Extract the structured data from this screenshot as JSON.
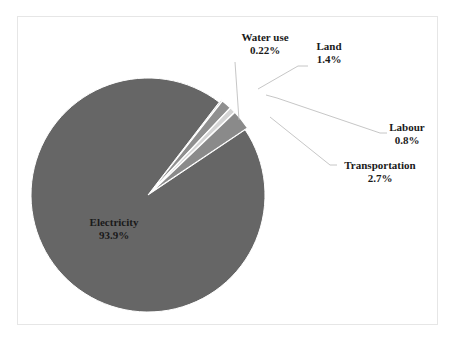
{
  "chart_data": {
    "type": "pie",
    "title": "",
    "categories": [
      "Electricity",
      "Water use",
      "Land",
      "Labour",
      "Transportation"
    ],
    "values": [
      93.9,
      0.22,
      1.4,
      0.8,
      2.7
    ],
    "value_labels": [
      "93.9%",
      "0.22%",
      "1.4%",
      "0.8%",
      "2.7%"
    ],
    "colors": [
      "#666666",
      "#a6a6a6",
      "#8f8f8f",
      "#d4d4d4",
      "#8a8a8a"
    ],
    "exploded": [
      "Water use",
      "Land",
      "Labour",
      "Transportation"
    ],
    "legend": "none",
    "data_labels": "category and percentage, leader lines for small slices"
  },
  "labels": {
    "electricity": {
      "name": "Electricity",
      "value": "93.9%"
    },
    "water": {
      "name": "Water use",
      "value": "0.22%"
    },
    "land": {
      "name": "Land",
      "value": "1.4%"
    },
    "labour": {
      "name": "Labour",
      "value": "0.8%"
    },
    "transport": {
      "name": "Transportation",
      "value": "2.7%"
    }
  }
}
